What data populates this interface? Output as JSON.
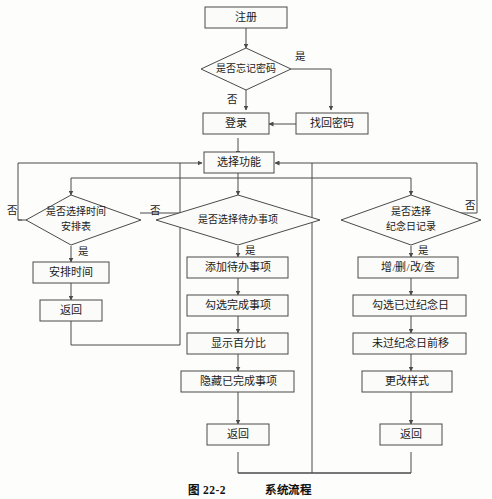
{
  "figure": {
    "caption_number": "图 22-2",
    "caption_title": "系统流程",
    "background_color": "#fdfdfb",
    "line_color": "#4a4a4a",
    "shape_fill": "#fbfbf9"
  },
  "nodes": {
    "register": {
      "label": "注册",
      "type": "process"
    },
    "forgot_password": {
      "label": "是否忘记密码",
      "type": "decision"
    },
    "retrieve_password": {
      "label": "找回密码",
      "type": "process"
    },
    "login": {
      "label": "登录",
      "type": "process"
    },
    "select_function": {
      "label": "选择功能",
      "type": "process"
    },
    "choose_schedule": {
      "label_line1": "是否选择时间",
      "label_line2": "安排表",
      "type": "decision"
    },
    "arrange_time": {
      "label": "安排时间",
      "type": "process"
    },
    "return_left": {
      "label": "返回",
      "type": "process"
    },
    "choose_todo": {
      "label": "是否选择待办事项",
      "type": "decision"
    },
    "add_todo": {
      "label": "添加待办事项",
      "type": "process"
    },
    "check_done": {
      "label": "勾选完成事项",
      "type": "process"
    },
    "show_percent": {
      "label": "显示百分比",
      "type": "process"
    },
    "hide_done": {
      "label": "隐藏已完成事项",
      "type": "process"
    },
    "return_mid": {
      "label": "返回",
      "type": "process"
    },
    "choose_anniversary": {
      "label_line1": "是否选择",
      "label_line2": "纪念日记录",
      "type": "decision"
    },
    "crud": {
      "label": "增/删/改/查",
      "type": "process"
    },
    "check_passed": {
      "label": "勾选已过纪念日",
      "type": "process"
    },
    "move_upcoming": {
      "label": "未过纪念日前移",
      "type": "process"
    },
    "change_style": {
      "label": "更改样式",
      "type": "process"
    },
    "return_right": {
      "label": "返回",
      "type": "process"
    }
  },
  "edge_labels": {
    "forgot_yes": "是",
    "forgot_no": "否",
    "schedule_no": "否",
    "schedule_yes": "是",
    "todo_no": "否",
    "todo_yes": "是",
    "anniversary_no": "否",
    "anniversary_yes": "是"
  }
}
